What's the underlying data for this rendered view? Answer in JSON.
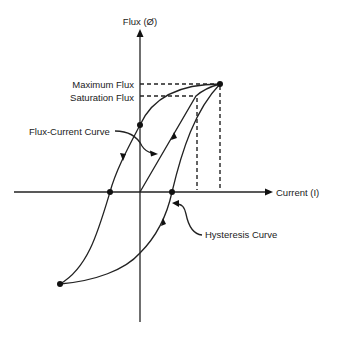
{
  "diagram": {
    "axes": {
      "y_label": "Flux (Ø)",
      "x_label": "Current (I)"
    },
    "levels": {
      "maximum_flux_label": "Maximum Flux",
      "saturation_flux_label": "Saturation Flux"
    },
    "callouts": {
      "flux_current_curve": "Flux-Current Curve",
      "hysteresis_curve": "Hysteresis Curve"
    },
    "points": [
      {
        "name": "maximum-flux-point",
        "x": 220,
        "y": 84
      },
      {
        "name": "residual-flux-point",
        "x": 140,
        "y": 125
      },
      {
        "name": "negative-coercive-point",
        "x": 110,
        "y": 192
      },
      {
        "name": "positive-coercive-point",
        "x": 172,
        "y": 192
      },
      {
        "name": "negative-max-point",
        "x": 60,
        "y": 284
      }
    ],
    "colors": {
      "stroke": "#222222",
      "background": "#ffffff"
    }
  }
}
